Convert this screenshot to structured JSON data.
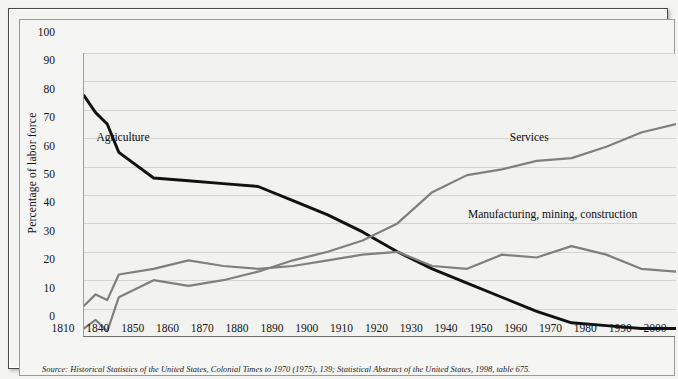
{
  "figure": {
    "source_note": "Source: Historical Statistics of the United States, Colonial Times to 1970 (1975), 139; Statistical Abstract of the United States, 1998, table 675.",
    "y_axis_title": "Percentage of labor force",
    "labels": {
      "agriculture": "Agriculture",
      "services": "Services",
      "manufacturing": "Manufacturing, mining, construction"
    }
  },
  "chart_data": {
    "type": "line",
    "title": "",
    "subtitle": "",
    "xlabel": "",
    "ylabel": "Percentage of labor force",
    "xlim": [
      1810,
      2000
    ],
    "ylim": [
      0,
      100
    ],
    "grid": true,
    "legend_position": "inline-annotations",
    "x_tick_labels": [
      "1810",
      "1840",
      "1850",
      "1860",
      "1870",
      "1880",
      "1890",
      "1900",
      "1910",
      "1920",
      "1930",
      "1940",
      "1950",
      "1960",
      "1970",
      "1980",
      "1990",
      "2000"
    ],
    "y_tick_labels": [
      "0",
      "10",
      "20",
      "30",
      "40",
      "50",
      "60",
      "70",
      "80",
      "90",
      "100"
    ],
    "x": [
      1810,
      1820,
      1830,
      1840,
      1850,
      1860,
      1870,
      1880,
      1890,
      1900,
      1910,
      1920,
      1930,
      1940,
      1950,
      1960,
      1970,
      1980,
      1990,
      2000
    ],
    "series": [
      {
        "name": "Agriculture",
        "color": "#111111",
        "values": [
          85,
          79,
          75,
          65,
          56,
          55,
          54,
          53,
          48,
          43,
          37,
          30,
          24,
          19,
          14,
          9,
          5,
          4,
          3,
          3
        ]
      },
      {
        "name": "Manufacturing, mining, construction",
        "color": "#7f7f7f",
        "values": [
          11,
          15,
          13,
          22,
          24,
          27,
          25,
          24,
          25,
          27,
          29,
          30,
          25,
          24,
          29,
          28,
          32,
          29,
          24,
          23
        ]
      },
      {
        "name": "Services",
        "color": "#7f7f7f",
        "values": [
          3,
          6,
          2,
          14,
          20,
          18,
          20,
          23,
          27,
          30,
          34,
          40,
          51,
          57,
          59,
          62,
          63,
          67,
          72,
          75
        ]
      }
    ],
    "annotations": [
      {
        "text": "Agriculture",
        "x": 1838,
        "y": 63
      },
      {
        "text": "Services",
        "x": 1958,
        "y": 63
      },
      {
        "text": "Manufacturing, mining, construction",
        "x": 1946,
        "y": 36
      }
    ]
  }
}
